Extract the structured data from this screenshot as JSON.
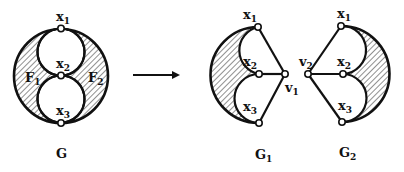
{
  "figure": {
    "graphs": [
      {
        "id": "G",
        "label": "G",
        "label_sub": "",
        "vertices": [
          {
            "name": "x",
            "sub": "1"
          },
          {
            "name": "x",
            "sub": "2"
          },
          {
            "name": "x",
            "sub": "3"
          }
        ],
        "faces": [
          {
            "name": "F",
            "sub": "1"
          },
          {
            "name": "F",
            "sub": "2"
          }
        ]
      },
      {
        "id": "G1",
        "label": "G",
        "label_sub": "1",
        "vertices": [
          {
            "name": "x",
            "sub": "1"
          },
          {
            "name": "x",
            "sub": "2"
          },
          {
            "name": "x",
            "sub": "3"
          },
          {
            "name": "v",
            "sub": "1"
          }
        ]
      },
      {
        "id": "G2",
        "label": "G",
        "label_sub": "2",
        "vertices": [
          {
            "name": "x",
            "sub": "1"
          },
          {
            "name": "x",
            "sub": "2"
          },
          {
            "name": "x",
            "sub": "3"
          },
          {
            "name": "v",
            "sub": "2"
          }
        ]
      }
    ],
    "arrow": "transforms-to",
    "colors": {
      "ink": "#111111",
      "background": "#ffffff"
    }
  }
}
